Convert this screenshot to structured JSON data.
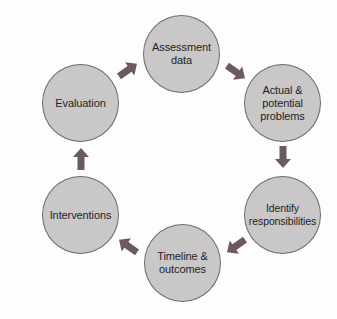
{
  "diagram": {
    "type": "cycle",
    "colors": {
      "node_fill": "#c9c7c7",
      "node_border": "#6f6b6b",
      "arrow": "#6b5a5e",
      "text": "#1f1f1f",
      "background": "#fdfdfd"
    },
    "nodes": [
      {
        "id": "assessment",
        "label": "Assessment\ndata"
      },
      {
        "id": "problems",
        "label": "Actual &\npotential\nproblems"
      },
      {
        "id": "responsibilities",
        "label": "Identify\nresponsibilities"
      },
      {
        "id": "timeline",
        "label": "Timeline &\noutcomes"
      },
      {
        "id": "interventions",
        "label": "Interventions"
      },
      {
        "id": "evaluation",
        "label": "Evaluation"
      }
    ],
    "edges": [
      {
        "from": "assessment",
        "to": "problems",
        "icon": "arrow-down-right-icon"
      },
      {
        "from": "problems",
        "to": "responsibilities",
        "icon": "arrow-down-icon"
      },
      {
        "from": "responsibilities",
        "to": "timeline",
        "icon": "arrow-down-left-icon"
      },
      {
        "from": "timeline",
        "to": "interventions",
        "icon": "arrow-up-left-icon"
      },
      {
        "from": "interventions",
        "to": "evaluation",
        "icon": "arrow-up-icon"
      },
      {
        "from": "evaluation",
        "to": "assessment",
        "icon": "arrow-up-right-icon"
      }
    ]
  }
}
